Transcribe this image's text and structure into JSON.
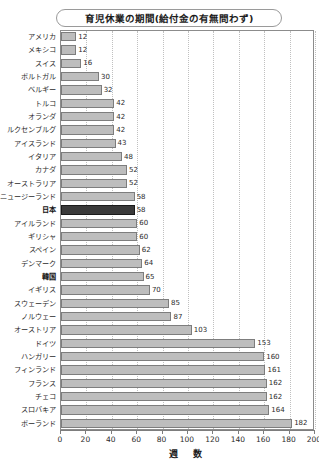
{
  "top_strip_text": "",
  "chart_title": "育児休業の期間(給付金の有無問わず)",
  "x_axis_title": "週　数",
  "chart_data": {
    "type": "bar",
    "orientation": "horizontal",
    "title": "育児休業の期間(給付金の有無問わず)",
    "xlabel": "週　数",
    "ylabel": "",
    "xlim": [
      0,
      200
    ],
    "xticks": [
      "0",
      "20",
      "40",
      "60",
      "80",
      "100",
      "120",
      "140",
      "160",
      "180",
      "200"
    ],
    "grid": "vertical-dotted",
    "legend": "none",
    "highlight_color": "#3a3a3a",
    "bar_color": "#bdbdbd",
    "categories": [
      "アメリカ",
      "メキシコ",
      "スイス",
      "ポルトガル",
      "ベルギー",
      "トルコ",
      "オランダ",
      "ルクセンブルグ",
      "アイスランド",
      "イタリア",
      "カナダ",
      "オーストラリア",
      "ニュージーランド",
      "日本",
      "アイルランド",
      "ギリシャ",
      "スペイン",
      "デンマーク",
      "韓国",
      "イギリス",
      "スウェーデン",
      "ノルウェー",
      "オーストリア",
      "ドイツ",
      "ハンガリー",
      "フィンランド",
      "フランス",
      "チェコ",
      "スロバキア",
      "ポーランド"
    ],
    "values": [
      12,
      12,
      16,
      30,
      32,
      42,
      42,
      42,
      43,
      48,
      52,
      52,
      58,
      58,
      60,
      60,
      62,
      64,
      65,
      70,
      85,
      87,
      103,
      153,
      160,
      161,
      162,
      162,
      164,
      182
    ],
    "highlighted": [
      "日本"
    ],
    "bold_labels": [
      "日本",
      "韓国"
    ]
  }
}
